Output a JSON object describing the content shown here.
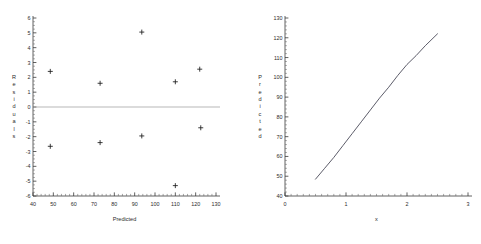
{
  "figure": {
    "background": "#ffffff",
    "panel_count": 2
  },
  "chart_data": [
    {
      "id": "residual-plot",
      "type": "scatter",
      "title": "",
      "xlabel": "Predicted",
      "ylabel": "Residuals",
      "xlim": [
        40,
        130
      ],
      "ylim": [
        -6,
        6
      ],
      "xticks": [
        40,
        50,
        60,
        70,
        80,
        90,
        100,
        110,
        120,
        130
      ],
      "yticks": [
        -6,
        -5,
        -4,
        -3,
        -2,
        -1,
        0,
        1,
        2,
        3,
        4,
        5,
        6
      ],
      "minor_ticks": true,
      "grid": false,
      "legend": "none",
      "marker": "plus",
      "reference_line": {
        "y": 0,
        "color": "#9a9a9a"
      },
      "points": [
        {
          "x": 48.5,
          "y": 2.4
        },
        {
          "x": 48.5,
          "y": -2.65
        },
        {
          "x": 73.0,
          "y": 1.6
        },
        {
          "x": 73.0,
          "y": -2.4
        },
        {
          "x": 93.5,
          "y": 5.05
        },
        {
          "x": 93.5,
          "y": -1.95
        },
        {
          "x": 110.0,
          "y": 1.7
        },
        {
          "x": 110.0,
          "y": -5.3
        },
        {
          "x": 122.0,
          "y": 2.55
        },
        {
          "x": 122.5,
          "y": -1.4
        }
      ]
    },
    {
      "id": "predicted-curve",
      "type": "line",
      "title": "",
      "xlabel": "x",
      "ylabel": "Predicted",
      "xlim": [
        0,
        3
      ],
      "ylim": [
        40,
        130
      ],
      "xticks": [
        0,
        1,
        2,
        3
      ],
      "yticks": [
        40,
        50,
        60,
        70,
        80,
        90,
        100,
        110,
        120,
        130
      ],
      "minor_ticks": true,
      "grid": false,
      "legend": "none",
      "series": [
        {
          "name": "Predicted",
          "color": "#4a4a58",
          "x": [
            0.5,
            0.65,
            0.8,
            0.95,
            1.1,
            1.25,
            1.4,
            1.55,
            1.7,
            1.85,
            2.0,
            2.15,
            2.3,
            2.5
          ],
          "y": [
            48.5,
            54.0,
            59.5,
            65.5,
            71.5,
            77.5,
            83.5,
            89.5,
            95.0,
            101.0,
            106.5,
            111.0,
            116.0,
            122.0
          ]
        }
      ]
    }
  ]
}
